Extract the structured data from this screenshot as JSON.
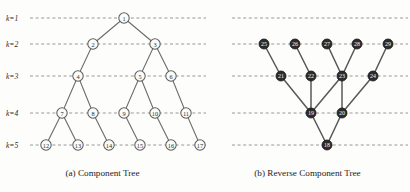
{
  "figure": {
    "width": 410,
    "height": 192,
    "background": "#fdfdfc"
  },
  "row_labels": [
    {
      "text": "k=1",
      "y": 18
    },
    {
      "text": "k=2",
      "y": 44
    },
    {
      "text": "k=3",
      "y": 76
    },
    {
      "text": "k=4",
      "y": 113
    },
    {
      "text": "k=5",
      "y": 145
    }
  ],
  "colors": {
    "gridline": "#8d8d8d",
    "edge_light": "#6a6a6a",
    "edge_dark": "#585858",
    "node_open_fill": "#fbfbfa",
    "node_open_stroke": "#5d5d5d",
    "node_filled_fill": "#2c2c2c",
    "node_filled_text": "#f4f4f4",
    "text": "#2a2a2a"
  },
  "panels": [
    {
      "id": "component-tree",
      "caption": "(a) Component Tree",
      "node_style": "open",
      "grid_x1": 30,
      "grid_x2": 206,
      "nodes": [
        {
          "label": "1",
          "k": 1,
          "x": 124,
          "y": 18
        },
        {
          "label": "2",
          "k": 2,
          "x": 93,
          "y": 44
        },
        {
          "label": "3",
          "k": 2,
          "x": 155,
          "y": 44
        },
        {
          "label": "4",
          "k": 3,
          "x": 78,
          "y": 76
        },
        {
          "label": "5",
          "k": 3,
          "x": 140,
          "y": 76
        },
        {
          "label": "6",
          "k": 3,
          "x": 171,
          "y": 76
        },
        {
          "label": "7",
          "k": 4,
          "x": 62,
          "y": 113
        },
        {
          "label": "8",
          "k": 4,
          "x": 93,
          "y": 113
        },
        {
          "label": "9",
          "k": 4,
          "x": 124,
          "y": 113
        },
        {
          "label": "10",
          "k": 4,
          "x": 155,
          "y": 113
        },
        {
          "label": "11",
          "k": 4,
          "x": 186,
          "y": 113
        },
        {
          "label": "12",
          "k": 5,
          "x": 46,
          "y": 145
        },
        {
          "label": "13",
          "k": 5,
          "x": 78,
          "y": 145
        },
        {
          "label": "14",
          "k": 5,
          "x": 109,
          "y": 145
        },
        {
          "label": "15",
          "k": 5,
          "x": 140,
          "y": 145
        },
        {
          "label": "16",
          "k": 5,
          "x": 171,
          "y": 145
        },
        {
          "label": "17",
          "k": 5,
          "x": 200,
          "y": 145
        }
      ],
      "edges": [
        [
          "1",
          "2"
        ],
        [
          "1",
          "3"
        ],
        [
          "2",
          "4"
        ],
        [
          "3",
          "5"
        ],
        [
          "3",
          "6"
        ],
        [
          "4",
          "7"
        ],
        [
          "4",
          "8"
        ],
        [
          "5",
          "9"
        ],
        [
          "5",
          "10"
        ],
        [
          "6",
          "11"
        ],
        [
          "7",
          "12"
        ],
        [
          "7",
          "13"
        ],
        [
          "8",
          "14"
        ],
        [
          "9",
          "15"
        ],
        [
          "10",
          "16"
        ],
        [
          "11",
          "17"
        ]
      ]
    },
    {
      "id": "reverse-component-tree",
      "caption": "(b) Reverse Component Tree",
      "node_style": "filled",
      "grid_x1": 232,
      "grid_x2": 408,
      "nodes": [
        {
          "label": "25",
          "k": 2,
          "x": 264,
          "y": 44
        },
        {
          "label": "26",
          "k": 2,
          "x": 295,
          "y": 44
        },
        {
          "label": "27",
          "k": 2,
          "x": 327,
          "y": 44
        },
        {
          "label": "28",
          "k": 2,
          "x": 357,
          "y": 44
        },
        {
          "label": "29",
          "k": 2,
          "x": 388,
          "y": 44
        },
        {
          "label": "21",
          "k": 3,
          "x": 281,
          "y": 76
        },
        {
          "label": "22",
          "k": 3,
          "x": 311,
          "y": 76
        },
        {
          "label": "23",
          "k": 3,
          "x": 342,
          "y": 76
        },
        {
          "label": "24",
          "k": 3,
          "x": 373,
          "y": 76
        },
        {
          "label": "19",
          "k": 4,
          "x": 311,
          "y": 113
        },
        {
          "label": "20",
          "k": 4,
          "x": 342,
          "y": 113
        },
        {
          "label": "18",
          "k": 5,
          "x": 327,
          "y": 145
        }
      ],
      "edges": [
        [
          "25",
          "21"
        ],
        [
          "26",
          "22"
        ],
        [
          "27",
          "23"
        ],
        [
          "28",
          "23"
        ],
        [
          "29",
          "24"
        ],
        [
          "21",
          "19"
        ],
        [
          "22",
          "19"
        ],
        [
          "23",
          "19"
        ],
        [
          "23",
          "20"
        ],
        [
          "24",
          "20"
        ],
        [
          "19",
          "18"
        ],
        [
          "20",
          "18"
        ]
      ]
    }
  ]
}
